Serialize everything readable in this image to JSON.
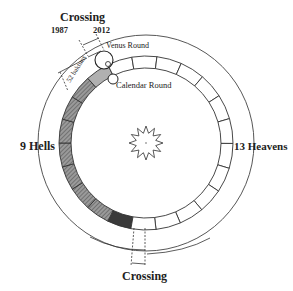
{
  "diagram": {
    "center": {
      "x": 146,
      "y": 143
    },
    "outer_circle_radius": 108,
    "ring": {
      "outer_radius": 87,
      "inner_radius": 75
    },
    "hells": {
      "label": "9 Hells",
      "count": 9,
      "start_deg": 100,
      "end_deg": 244,
      "fill": "#8a8a8a"
    },
    "heavens": {
      "label": "13 Heavens",
      "count": 13,
      "fill": "#ffffff"
    },
    "labels": {
      "top_crossing": "Crossing",
      "year_start": "1987",
      "year_end": "2012",
      "venus_round": "Venus Round",
      "calendar_round": "Calendar Round",
      "katuns": "52 baktuns",
      "bottom_crossing": "Crossing",
      "hells": "9 Hells",
      "heavens": "13 Heavens"
    },
    "colors": {
      "line": "#333333",
      "hatch": "#7a7a7a",
      "dark_cell": "#3a3a3a"
    }
  }
}
